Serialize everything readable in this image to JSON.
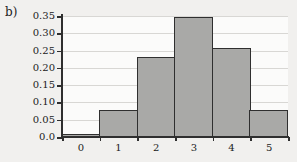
{
  "panel": {
    "label": "b)"
  },
  "chart_data": {
    "type": "bar",
    "title": "",
    "xlabel": "",
    "ylabel": "",
    "categories": [
      "0",
      "1",
      "2",
      "3",
      "4",
      "5"
    ],
    "values": [
      0.01,
      0.077,
      0.231,
      0.346,
      0.258,
      0.079
    ],
    "ylim": [
      0.0,
      0.35
    ],
    "xlim": [
      -0.5,
      5.5
    ],
    "y_ticks": [
      0.0,
      0.05,
      0.1,
      0.15,
      0.2,
      0.25,
      0.3,
      0.35
    ],
    "y_tick_labels": [
      "0.0",
      "0.05",
      "0.10",
      "0.15",
      "0.20",
      "0.25",
      "0.30",
      "0.35"
    ],
    "x_tick_labels": [
      "0",
      "1",
      "2",
      "3",
      "4",
      "5"
    ],
    "grid": true,
    "grid_axis": "y",
    "legend": null,
    "bar_fill_color": "#a9a9a7",
    "bar_edge_color": "#2f2f2f",
    "grid_color": "#d8d7d4",
    "background_color": "#f1f0ee",
    "plot_background_color": "#fbfbfa",
    "axis_color": "#2f2f2f"
  }
}
